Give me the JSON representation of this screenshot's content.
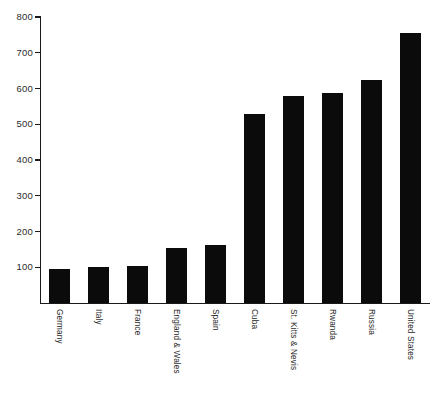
{
  "chart_data": {
    "type": "bar",
    "title": "",
    "subtitle": "",
    "xlabel": "",
    "ylabel": "",
    "categories": [
      "Germany",
      "Italy",
      "France",
      "England & Wales",
      "Spain",
      "Cuba",
      "St. Kitts & Nevis",
      "Rwanda",
      "Russia",
      "United States"
    ],
    "values": [
      95,
      100,
      103,
      154,
      162,
      530,
      580,
      588,
      625,
      755
    ],
    "ylim": [
      0,
      800
    ],
    "yticks": [
      100,
      200,
      300,
      400,
      500,
      600,
      700,
      800
    ],
    "ytick_labels": [
      "100",
      "200",
      "300",
      "400",
      "500",
      "600",
      "700",
      "800"
    ],
    "bar_color": "#0b0b0b",
    "axis_color": "#1a1a1a",
    "background_color": "#ffffff",
    "grid": false,
    "legend": null,
    "legend_position": "none",
    "annotations": []
  }
}
